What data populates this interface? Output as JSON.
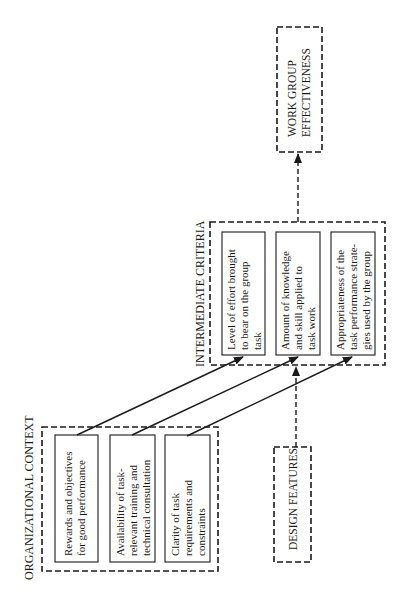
{
  "diagram": {
    "orientation": "rotated-90-ccw",
    "organizational_context": {
      "title": "ORGANIZATIONAL CONTEXT",
      "items": [
        {
          "lines": [
            "Rewards and objectives",
            "for good performance"
          ]
        },
        {
          "lines": [
            "Availability of task-",
            "relevant training and",
            "technical consultation"
          ]
        },
        {
          "lines": [
            "Clarity of task",
            "requirements and",
            "constraints"
          ]
        }
      ]
    },
    "design_features": {
      "title": "DESIGN FEATURES"
    },
    "intermediate_criteria": {
      "title": "INTERMEDIATE CRITERIA",
      "items": [
        {
          "lines": [
            "Level of effort brought",
            "to bear on the group",
            "task"
          ]
        },
        {
          "lines": [
            "Amount of knowledge",
            "and skill applied to",
            "task work"
          ]
        },
        {
          "lines": [
            "Appropriateness of the",
            "task performance strate-",
            "gies used by the group"
          ]
        }
      ]
    },
    "outcome": {
      "lines": [
        "WORK GROUP",
        "EFFECTIVENESS"
      ]
    },
    "connections": [
      {
        "from": "Rewards and objectives for good performance",
        "to": "Level of effort brought to bear on the group task",
        "style": "solid"
      },
      {
        "from": "Availability of task-relevant training and technical consultation",
        "to": "Amount of knowledge and skill applied to task work",
        "style": "solid"
      },
      {
        "from": "Clarity of task requirements and constraints",
        "to": "Appropriateness of the task performance strategies used by the group",
        "style": "solid"
      },
      {
        "from": "DESIGN FEATURES",
        "to": "INTERMEDIATE CRITERIA",
        "style": "dashed"
      },
      {
        "from": "INTERMEDIATE CRITERIA",
        "to": "WORK GROUP EFFECTIVENESS",
        "style": "dashed"
      }
    ]
  }
}
